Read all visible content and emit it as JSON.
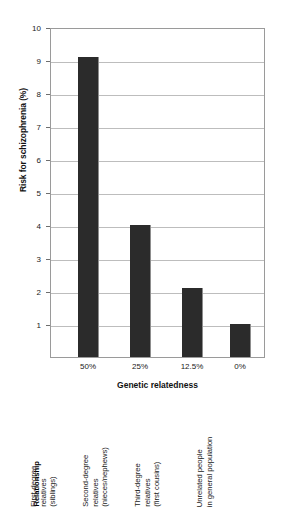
{
  "chart_data": {
    "type": "bar",
    "title": "",
    "xlabel": "Genetic relatedness",
    "ylabel": "Risk for schizophrenia (%)",
    "categories": [
      "50%",
      "25%",
      "12.5%",
      "0%"
    ],
    "values": [
      9.1,
      4.0,
      2.1,
      1.0
    ],
    "ylim": [
      0,
      10
    ],
    "yticks": [
      1,
      2,
      3,
      4,
      5,
      6,
      7,
      8,
      9,
      10
    ],
    "ytick_labels": [
      "1",
      "2",
      "3",
      "4",
      "5",
      "6",
      "7",
      "8",
      "9",
      "10"
    ],
    "grid": true,
    "legend": "none",
    "bar_color": "#2b2b2b",
    "plot_border_color": "#9a9a9a",
    "gridline_color": "#bdbdbd",
    "background_color": "#ffffff",
    "relationship_header": "Relationship",
    "relationship_labels": [
      [
        "First-degree",
        "relatives",
        "(siblings)"
      ],
      [
        "Second-degree",
        "relatives",
        "(nieces/nephews)"
      ],
      [
        "Third-degree",
        "relatives",
        "(first cousins)"
      ],
      [
        "Unrelated people",
        "in general  population"
      ]
    ]
  },
  "axis": {
    "y_title": "Risk for schizophrenia (%)",
    "x_title": "Genetic relatedness",
    "y_tick_1": "1",
    "y_tick_2": "2",
    "y_tick_3": "3",
    "y_tick_4": "4",
    "y_tick_5": "5",
    "y_tick_6": "6",
    "y_tick_7": "7",
    "y_tick_8": "8",
    "y_tick_9": "9",
    "y_tick_10": "10",
    "x_tick_0": "50%",
    "x_tick_1": "25%",
    "x_tick_2": "12.5%",
    "x_tick_3": "0%"
  },
  "relationship": {
    "header": "Relationship",
    "item_0_line_0": "First-degree",
    "item_0_line_1": "relatives",
    "item_0_line_2": "(siblings)",
    "item_1_line_0": "Second-degree",
    "item_1_line_1": "relatives",
    "item_1_line_2": "(nieces/nephews)",
    "item_2_line_0": "Third-degree",
    "item_2_line_1": "relatives",
    "item_2_line_2": "(first cousins)",
    "item_3_line_0": "Unrelated people",
    "item_3_line_1": "in general  population"
  }
}
